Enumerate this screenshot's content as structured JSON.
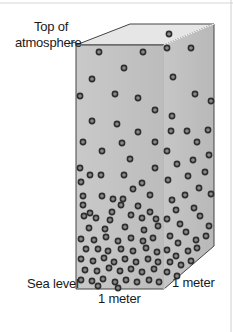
{
  "diagram": {
    "labels": {
      "top_line1": "Top of",
      "top_line2": "atmosphere",
      "sea_level": "Sea level",
      "width": "1 meter",
      "depth": "1 meter"
    },
    "colors": {
      "front_face": "#c4c4c4",
      "right_face": "#bdbdbd",
      "top_face": "#e6e6e6",
      "edge": "#444444",
      "molecule_ring": "#2e2e2e",
      "molecule_fill": "#8a8a8a"
    },
    "geometry": {
      "front": [
        [
          76,
          45
        ],
        [
          164,
          45
        ],
        [
          164,
          289
        ],
        [
          76,
          289
        ]
      ],
      "right": [
        [
          164,
          45
        ],
        [
          214,
          24
        ],
        [
          214,
          246
        ],
        [
          164,
          289
        ]
      ],
      "top": [
        [
          76,
          45
        ],
        [
          130,
          24
        ],
        [
          214,
          24
        ],
        [
          164,
          45
        ]
      ]
    },
    "molecules": [
      [
        99,
        52
      ],
      [
        143,
        52
      ],
      [
        124,
        68
      ],
      [
        92,
        79
      ],
      [
        80,
        96
      ],
      [
        115,
        94
      ],
      [
        138,
        98
      ],
      [
        155,
        110
      ],
      [
        92,
        121
      ],
      [
        117,
        124
      ],
      [
        138,
        132
      ],
      [
        83,
        142
      ],
      [
        122,
        143
      ],
      [
        155,
        142
      ],
      [
        102,
        151
      ],
      [
        130,
        159
      ],
      [
        80,
        168
      ],
      [
        155,
        168
      ],
      [
        90,
        175
      ],
      [
        101,
        175
      ],
      [
        124,
        175
      ],
      [
        81,
        182
      ],
      [
        142,
        183
      ],
      [
        133,
        189
      ],
      [
        83,
        196
      ],
      [
        102,
        196
      ],
      [
        113,
        199
      ],
      [
        123,
        199
      ],
      [
        150,
        195
      ],
      [
        83,
        205
      ],
      [
        90,
        213
      ],
      [
        112,
        212
      ],
      [
        121,
        205
      ],
      [
        138,
        206
      ],
      [
        150,
        212
      ],
      [
        84,
        216
      ],
      [
        96,
        218
      ],
      [
        110,
        220
      ],
      [
        131,
        215
      ],
      [
        142,
        218
      ],
      [
        156,
        219
      ],
      [
        89,
        228
      ],
      [
        105,
        229
      ],
      [
        125,
        227
      ],
      [
        144,
        230
      ],
      [
        158,
        226
      ],
      [
        81,
        239
      ],
      [
        94,
        240
      ],
      [
        106,
        237
      ],
      [
        118,
        241
      ],
      [
        131,
        238
      ],
      [
        143,
        241
      ],
      [
        153,
        238
      ],
      [
        86,
        249
      ],
      [
        98,
        249
      ],
      [
        108,
        251
      ],
      [
        121,
        249
      ],
      [
        133,
        251
      ],
      [
        146,
        248
      ],
      [
        157,
        252
      ],
      [
        81,
        259
      ],
      [
        93,
        261
      ],
      [
        104,
        258
      ],
      [
        114,
        262
      ],
      [
        125,
        259
      ],
      [
        136,
        262
      ],
      [
        148,
        259
      ],
      [
        158,
        262
      ],
      [
        85,
        270
      ],
      [
        97,
        271
      ],
      [
        109,
        268
      ],
      [
        120,
        271
      ],
      [
        131,
        269
      ],
      [
        142,
        272
      ],
      [
        154,
        269
      ],
      [
        81,
        280
      ],
      [
        92,
        281
      ],
      [
        103,
        279
      ],
      [
        115,
        282
      ],
      [
        126,
        280
      ],
      [
        137,
        282
      ],
      [
        149,
        280
      ],
      [
        159,
        282
      ],
      [
        98,
        286
      ],
      [
        118,
        288
      ],
      [
        169,
        34
      ],
      [
        167,
        48
      ],
      [
        191,
        48
      ],
      [
        173,
        77
      ],
      [
        195,
        94
      ],
      [
        211,
        101
      ],
      [
        172,
        116
      ],
      [
        171,
        131
      ],
      [
        187,
        131
      ],
      [
        208,
        130
      ],
      [
        197,
        142
      ],
      [
        167,
        151
      ],
      [
        209,
        155
      ],
      [
        177,
        164
      ],
      [
        193,
        160
      ],
      [
        205,
        172
      ],
      [
        168,
        180
      ],
      [
        188,
        176
      ],
      [
        199,
        188
      ],
      [
        172,
        200
      ],
      [
        185,
        195
      ],
      [
        211,
        194
      ],
      [
        176,
        210
      ],
      [
        194,
        208
      ],
      [
        167,
        219
      ],
      [
        180,
        224
      ],
      [
        200,
        216
      ],
      [
        209,
        226
      ],
      [
        186,
        232
      ],
      [
        170,
        236
      ],
      [
        178,
        243
      ],
      [
        196,
        240
      ],
      [
        206,
        236
      ],
      [
        167,
        250
      ],
      [
        176,
        256
      ],
      [
        188,
        251
      ],
      [
        197,
        248
      ],
      [
        170,
        262
      ],
      [
        181,
        265
      ],
      [
        191,
        261
      ],
      [
        167,
        272
      ],
      [
        177,
        276
      ]
    ]
  }
}
